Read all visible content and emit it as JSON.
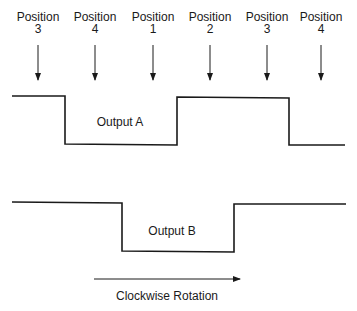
{
  "diagram": {
    "positions": [
      {
        "label": "Position",
        "number": "3",
        "x": 38
      },
      {
        "label": "Position",
        "number": "4",
        "x": 95
      },
      {
        "label": "Position",
        "number": "1",
        "x": 153
      },
      {
        "label": "Position",
        "number": "2",
        "x": 210
      },
      {
        "label": "Position",
        "number": "3",
        "x": 267
      },
      {
        "label": "Position",
        "number": "4",
        "x": 321
      }
    ],
    "output_a": {
      "label": "Output A",
      "points": "12,96 65,96 65,144 177,145 177,97 289,98 289,145 345,145"
    },
    "output_b": {
      "label": "Output B",
      "points": "12,202 122,203 122,251 234,252 234,204 346,204"
    },
    "rotation": {
      "label": "Clockwise Rotation",
      "arrow_from": 94,
      "arrow_to": 240
    }
  }
}
